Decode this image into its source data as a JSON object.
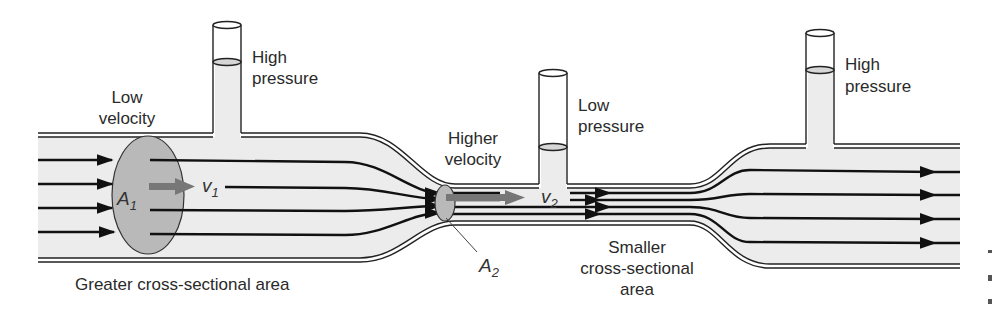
{
  "diagram": {
    "type": "venturi-flow",
    "colors": {
      "fluid": "#ececec",
      "wall": "#222222",
      "cross_section": "#b4b4b4",
      "velocity_arrow": "#777777",
      "streamline": "#111111",
      "text": "#2a2a2a"
    },
    "labels": {
      "low_velocity_line1": "Low",
      "low_velocity_line2": "velocity",
      "high_pressure_left_line1": "High",
      "high_pressure_left_line2": "pressure",
      "higher_velocity_line1": "Higher",
      "higher_velocity_line2": "velocity",
      "low_pressure_line1": "Low",
      "low_pressure_line2": "pressure",
      "high_pressure_right_line1": "High",
      "high_pressure_right_line2": "pressure",
      "greater_area": "Greater cross-sectional area",
      "smaller_area_line1": "Smaller",
      "smaller_area_line2": "cross-sectional",
      "smaller_area_line3": "area"
    },
    "symbols": {
      "area1": "A",
      "area1_sub": "1",
      "velocity1": "v",
      "velocity1_sub": "1",
      "area2": "A",
      "area2_sub": "2",
      "velocity2": "v",
      "velocity2_sub": "2"
    }
  }
}
